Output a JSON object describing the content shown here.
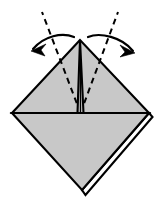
{
  "diagram": {
    "title": "Origami fold step diagram",
    "kind": "origami-instruction-step",
    "canvas": {
      "width": 162,
      "height": 198
    },
    "colors": {
      "paper_fill": "#c8c8c8",
      "paper_fill_upper": "#c8c8c8",
      "outline": "#000000",
      "fold_line": "#000000",
      "arrow": "#000000",
      "background": "#ffffff"
    },
    "stroke_widths": {
      "outline": 2.1,
      "crease": 1.3,
      "fold_dashed": 2.0,
      "arrow": 2.2
    },
    "dash_patterns": {
      "fold_dashed": "6,4.5",
      "guide_dashed": "6,5"
    },
    "points": {
      "apex": {
        "x": 80,
        "y": 40
      },
      "left_vertex": {
        "x": 12,
        "y": 113
      },
      "right_vertex": {
        "x": 149,
        "y": 113
      },
      "bottom_vertex": {
        "x": 82,
        "y": 190
      },
      "center_crease": {
        "x": 80.5,
        "y": 113
      },
      "flap_left_edge": {
        "x": 77.5,
        "y": 113
      },
      "flap_right_edge": {
        "x": 83.5,
        "y": 113
      }
    },
    "shapes": {
      "upper_triangle_path": "M 80 40 L 12 113 L 149 113 Z",
      "lower_triangle_path": "M 12 113 L 149 113 L 82 190 Z",
      "center_flap_path": "M 80 40 L 77.5 113 L 83.5 113 Z",
      "layer_edge_right_path": "M 149 113 L 82 190",
      "layer_edge_offset_path": "M 151 116 L 85 194"
    },
    "fold_lines": [
      {
        "name": "left-valley-fold",
        "from": {
          "x": 80.5,
          "y": 113
        },
        "to": {
          "x": 42,
          "y": 12
        },
        "style": "dashed"
      },
      {
        "name": "right-valley-fold",
        "from": {
          "x": 80.5,
          "y": 113
        },
        "to": {
          "x": 118,
          "y": 12
        },
        "style": "dashed"
      }
    ],
    "arrows": [
      {
        "name": "left-fold-arrow",
        "direction": "down-left",
        "path": "M 74 37 C 62 32 44 36 33 49",
        "tip": {
          "x": 31,
          "y": 51
        },
        "head_path": "M 31 51 L 46 44 L 41 50 L 45 56 Z"
      },
      {
        "name": "right-fold-arrow",
        "direction": "down-right",
        "path": "M 88 37 C 100 32 122 37 133 51",
        "tip": {
          "x": 135,
          "y": 53
        },
        "head_path": "M 135 53 L 120 45 L 125 52 L 120 57 Z"
      }
    ],
    "creases": [
      {
        "name": "horizontal-center-crease",
        "from": {
          "x": 12,
          "y": 113
        },
        "to": {
          "x": 149,
          "y": 113
        }
      }
    ],
    "labels": {
      "step_number": "",
      "caption": ""
    }
  }
}
